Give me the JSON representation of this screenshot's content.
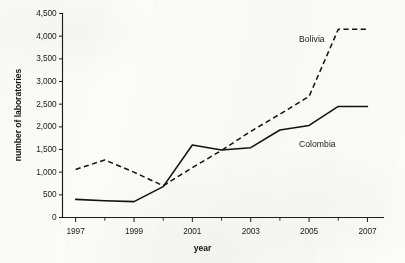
{
  "chart_data": {
    "type": "line",
    "title": "",
    "xlabel": "year",
    "ylabel": "number of laboratories",
    "x": [
      1997,
      1998,
      1999,
      2000,
      2001,
      2002,
      2003,
      2004,
      2005,
      2006,
      2007
    ],
    "xlim": [
      1996.55,
      2007.55
    ],
    "ylim": [
      0,
      4500
    ],
    "grid": false,
    "legend_position": "inline-labels",
    "y_ticks": [
      0,
      500,
      1000,
      1500,
      2000,
      2500,
      3000,
      3500,
      4000,
      4500
    ],
    "y_tick_labels": [
      "0",
      "500",
      "1,000",
      "1,500",
      "2,000",
      "2,500",
      "3,000",
      "3,500",
      "4,000",
      "4,500"
    ],
    "x_ticks": [
      1997,
      1998,
      1999,
      2000,
      2001,
      2002,
      2003,
      2004,
      2005,
      2006,
      2007
    ],
    "x_tick_labels": [
      "1997",
      "",
      "1999",
      "",
      "2001",
      "",
      "2003",
      "",
      "2005",
      "",
      "2007"
    ],
    "x_labeled_ticks": [
      "1997",
      "1999",
      "2001",
      "2003",
      "2005",
      "2007"
    ],
    "series": [
      {
        "name": "Bolivia",
        "style": "dashed",
        "color": "#111110",
        "values": [
          1060,
          1270,
          1000,
          700,
          1100,
          1480,
          1900,
          2280,
          2670,
          4150,
          4150
        ]
      },
      {
        "name": "Colombia",
        "style": "solid",
        "color": "#111110",
        "values": [
          400,
          370,
          350,
          680,
          1600,
          1490,
          1540,
          1930,
          2030,
          2450,
          2450
        ]
      }
    ],
    "annotations": [
      {
        "text": "Bolivia",
        "series": "Bolivia"
      },
      {
        "text": "Colombia",
        "series": "Colombia"
      }
    ]
  },
  "axes": {
    "y_title": "number of laboratories",
    "x_title": "year"
  },
  "labels": {
    "bolivia": "Bolivia",
    "colombia": "Colombia"
  },
  "colors": {
    "ink": "#111110",
    "axis": "#1d1d1b",
    "page": "#fbfbf9"
  }
}
